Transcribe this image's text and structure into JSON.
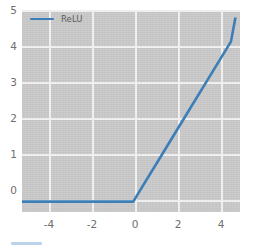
{
  "chart_data": {
    "type": "line",
    "title": "",
    "xlabel": "",
    "ylabel": "",
    "xlim": [
      -5.2,
      4.4
    ],
    "ylim": [
      -0.28,
      5.15
    ],
    "grid": true,
    "grid_color": "#f2f2f2",
    "axes_facecolor": "#c9c9c9",
    "figure_facecolor": "#ffffff",
    "legend": {
      "position": "upper left",
      "frame": false,
      "entries": [
        {
          "label": "ReLU",
          "color": "#3b7eb8",
          "linewidth": 2.4
        }
      ]
    },
    "xticks": [
      -4,
      -2,
      0,
      2,
      4
    ],
    "xticklabels": [
      "-4",
      "-2",
      "0",
      "2",
      "4"
    ],
    "yticks": [
      0,
      1,
      2,
      3,
      4,
      5
    ],
    "yticklabels": [
      "0",
      "1",
      "2",
      "3",
      "4",
      "5"
    ],
    "series": [
      {
        "name": "ReLU",
        "color": "#3b7eb8",
        "x": [
          -5.2,
          -4,
          -3,
          -2,
          -1,
          -0.3,
          0,
          1,
          2,
          3,
          4,
          4.2
        ],
        "values": [
          0,
          0,
          0,
          0,
          0,
          0,
          0.3,
          1.3,
          2.3,
          3.3,
          4.3,
          4.95
        ]
      }
    ]
  },
  "legend": {
    "label": "ReLU"
  },
  "axis": {
    "x": {
      "labels": [
        "-4",
        "-2",
        "0",
        "2",
        "4"
      ]
    },
    "y": {
      "labels": [
        "5",
        "4",
        "3",
        "2",
        "1",
        "0"
      ]
    }
  }
}
